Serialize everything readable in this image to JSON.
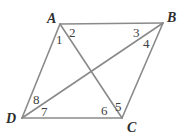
{
  "figure": {
    "shape_type": "parallelogram",
    "canvas": {
      "width": 183,
      "height": 137
    },
    "colors": {
      "background": "#ffffff",
      "stroke": "#8a8a8a",
      "vertex_label": "#2e2e2e",
      "angle_label": "#3d3d3d"
    },
    "vertices": [
      {
        "name": "A",
        "label": "A",
        "x": 60,
        "y": 24,
        "label_x": 47,
        "label_y": 12
      },
      {
        "name": "B",
        "label": "B",
        "x": 163,
        "y": 23,
        "label_x": 167,
        "label_y": 11
      },
      {
        "name": "C",
        "label": "C",
        "x": 122,
        "y": 118,
        "label_x": 127,
        "label_y": 121
      },
      {
        "name": "D",
        "label": "D",
        "x": 22,
        "y": 118,
        "label_x": 6,
        "label_y": 112
      }
    ],
    "sides": [
      {
        "name": "AB",
        "from": "A",
        "to": "B"
      },
      {
        "name": "BC",
        "from": "B",
        "to": "C"
      },
      {
        "name": "CD",
        "from": "C",
        "to": "D"
      },
      {
        "name": "DA",
        "from": "D",
        "to": "A"
      }
    ],
    "diagonals": [
      {
        "name": "AC",
        "from": "A",
        "to": "C"
      },
      {
        "name": "BD",
        "from": "B",
        "to": "D"
      }
    ],
    "intersection": {
      "name": "diagonal-intersection",
      "x": 92,
      "y": 71
    },
    "angles": [
      {
        "id": "1",
        "label": "1",
        "at_vertex": "A",
        "x": 56,
        "y": 33
      },
      {
        "id": "2",
        "label": "2",
        "at_vertex": "A",
        "x": 69,
        "y": 26
      },
      {
        "id": "3",
        "label": "3",
        "at_vertex": "B",
        "x": 133,
        "y": 26
      },
      {
        "id": "4",
        "label": "4",
        "at_vertex": "B",
        "x": 143,
        "y": 37
      },
      {
        "id": "5",
        "label": "5",
        "at_vertex": "C",
        "x": 115,
        "y": 100
      },
      {
        "id": "6",
        "label": "6",
        "at_vertex": "C",
        "x": 101,
        "y": 104
      },
      {
        "id": "7",
        "label": "7",
        "at_vertex": "D",
        "x": 41,
        "y": 105
      },
      {
        "id": "8",
        "label": "8",
        "at_vertex": "D",
        "x": 33,
        "y": 93
      }
    ]
  }
}
